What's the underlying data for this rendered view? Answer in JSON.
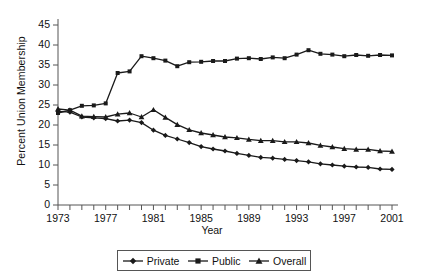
{
  "chart_data": {
    "type": "line",
    "title": "",
    "xlabel": "Year",
    "ylabel": "Percent Union Membership",
    "xlim": [
      1973,
      2001
    ],
    "ylim": [
      0,
      45
    ],
    "ytick_step": 5,
    "xtick_step": 1,
    "xtick_label_step": 4,
    "grid": false,
    "legend_position": "bottom",
    "axis_color": "#555555",
    "series_color": "#1a1a1a",
    "yticks": [
      0,
      5,
      10,
      15,
      20,
      25,
      30,
      35,
      40,
      45
    ],
    "xticks": [
      1973,
      1974,
      1975,
      1976,
      1977,
      1978,
      1979,
      1980,
      1981,
      1982,
      1983,
      1984,
      1985,
      1986,
      1987,
      1988,
      1989,
      1990,
      1991,
      1992,
      1993,
      1994,
      1995,
      1996,
      1997,
      1998,
      1999,
      2000,
      2001
    ],
    "xtick_labels": [
      "1973",
      "1977",
      "1981",
      "1985",
      "1989",
      "1993",
      "1997",
      "2001"
    ],
    "xtick_label_years": [
      1973,
      1977,
      1981,
      1985,
      1989,
      1993,
      1997,
      2001
    ],
    "x": [
      1973,
      1974,
      1975,
      1976,
      1977,
      1978,
      1979,
      1980,
      1981,
      1982,
      1983,
      1984,
      1985,
      1986,
      1987,
      1988,
      1989,
      1990,
      1991,
      1992,
      1993,
      1994,
      1995,
      1996,
      1997,
      1998,
      1999,
      2000,
      2001
    ],
    "series": [
      {
        "name": "Private",
        "marker": "diamond",
        "values": [
          23.4,
          23.2,
          22.0,
          21.8,
          21.6,
          21.0,
          21.2,
          20.6,
          18.7,
          17.4,
          16.5,
          15.6,
          14.6,
          14.0,
          13.5,
          12.9,
          12.4,
          11.9,
          11.7,
          11.4,
          11.1,
          10.8,
          10.3,
          10.0,
          9.7,
          9.5,
          9.4,
          9.0,
          8.9
        ]
      },
      {
        "name": "Public",
        "marker": "square",
        "values": [
          23.0,
          23.7,
          24.8,
          24.9,
          25.4,
          33.0,
          33.4,
          37.2,
          36.7,
          36.1,
          34.7,
          35.7,
          35.8,
          36.0,
          36.0,
          36.6,
          36.7,
          36.5,
          36.9,
          36.7,
          37.6,
          38.7,
          37.8,
          37.6,
          37.2,
          37.5,
          37.3,
          37.5,
          37.4
        ]
      },
      {
        "name": "Overall",
        "marker": "triangle",
        "values": [
          24.0,
          23.7,
          22.2,
          22.1,
          22.0,
          22.7,
          23.0,
          22.0,
          23.8,
          21.9,
          20.1,
          18.8,
          18.0,
          17.5,
          17.0,
          16.8,
          16.4,
          16.1,
          16.1,
          15.8,
          15.8,
          15.5,
          14.9,
          14.5,
          14.1,
          13.9,
          13.9,
          13.5,
          13.4
        ]
      }
    ]
  },
  "legend": {
    "items": [
      {
        "label": "Private"
      },
      {
        "label": "Public"
      },
      {
        "label": "Overall"
      }
    ]
  }
}
